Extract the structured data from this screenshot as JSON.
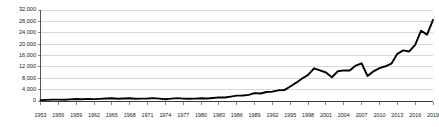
{
  "chart_data": {
    "type": "line",
    "title": "",
    "subtitle": "",
    "xlabel": "",
    "ylabel": "",
    "grid": true,
    "legend": false,
    "legend_position": "none",
    "line_color": "#000000",
    "grid_color": "#c8c8c8",
    "axis_color": "#555555",
    "background_color": "#ffffff",
    "xlim": [
      1953,
      2019
    ],
    "ylim": [
      0,
      32000
    ],
    "ytick_values": [
      0,
      4000,
      8000,
      12000,
      16000,
      20000,
      24000,
      28000,
      32000
    ],
    "ytick_labels": [
      "0",
      "4,000",
      "8,000",
      "12,000",
      "16,000",
      "20,000",
      "24,000",
      "28,000",
      "32,000"
    ],
    "xtick_values": [
      1953,
      1956,
      1959,
      1962,
      1965,
      1968,
      1971,
      1974,
      1977,
      1980,
      1983,
      1986,
      1989,
      1992,
      1995,
      1998,
      2001,
      2004,
      2007,
      2010,
      2013,
      2016,
      2019
    ],
    "xtick_labels": [
      "1953",
      "1956",
      "1959",
      "1962",
      "1965",
      "1968",
      "1971",
      "1974",
      "1977",
      "1980",
      "1983",
      "1986",
      "1989",
      "1992",
      "1995",
      "1998",
      "2001",
      "2004",
      "2007",
      "2010",
      "2013",
      "2016",
      "2019"
    ],
    "series": [
      {
        "name": "Index level",
        "x": [
          1953,
          1954,
          1955,
          1956,
          1957,
          1958,
          1959,
          1960,
          1961,
          1962,
          1963,
          1964,
          1965,
          1966,
          1967,
          1968,
          1969,
          1970,
          1971,
          1972,
          1973,
          1974,
          1975,
          1976,
          1977,
          1978,
          1979,
          1980,
          1981,
          1982,
          1983,
          1984,
          1985,
          1986,
          1987,
          1988,
          1989,
          1990,
          1991,
          1992,
          1993,
          1994,
          1995,
          1996,
          1997,
          1998,
          1999,
          2000,
          2001,
          2002,
          2003,
          2004,
          2005,
          2006,
          2007,
          2008,
          2009,
          2010,
          2011,
          2012,
          2013,
          2014,
          2015,
          2016,
          2017,
          2018,
          2019
        ],
        "values": [
          281,
          404,
          488,
          499,
          436,
          584,
          679,
          616,
          731,
          652,
          763,
          874,
          969,
          786,
          905,
          944,
          800,
          839,
          890,
          1020,
          851,
          616,
          852,
          1005,
          831,
          805,
          839,
          964,
          875,
          1047,
          1259,
          1212,
          1547,
          1896,
          1939,
          2169,
          2753,
          2634,
          3169,
          3301,
          3754,
          3834,
          5117,
          6448,
          7908,
          9181,
          11497,
          10787,
          10022,
          8342,
          10454,
          10783,
          10718,
          12463,
          13265,
          8776,
          10428,
          11578,
          12218,
          13104,
          16577,
          17823,
          17425,
          19763,
          24719,
          23327,
          28538
        ]
      }
    ],
    "annotations": []
  }
}
